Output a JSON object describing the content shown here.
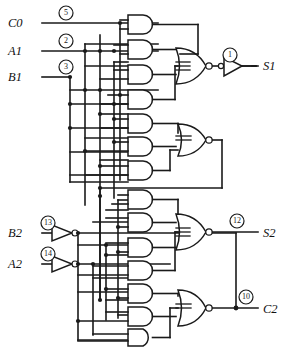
{
  "diagram": {
    "background": "#ffffff",
    "ink": "#1a1a1a"
  },
  "inputs": [
    {
      "name": "input-c0",
      "label": "C0",
      "pin": "5",
      "x": 22,
      "y": 23,
      "wire_y": 23
    },
    {
      "name": "input-a1",
      "label": "A1",
      "pin": "2",
      "x": 22,
      "y": 51,
      "wire_y": 51
    },
    {
      "name": "input-b1",
      "label": "B1",
      "pin": "3",
      "x": 22,
      "y": 77,
      "wire_y": 77
    },
    {
      "name": "input-b2",
      "label": "B2",
      "pin": "13",
      "x": 22,
      "y": 233,
      "wire_y": 233
    },
    {
      "name": "input-a2",
      "label": "A2",
      "pin": "14",
      "x": 22,
      "y": 264,
      "wire_y": 264
    }
  ],
  "outputs": [
    {
      "name": "output-s1",
      "label": "S1",
      "pin": "1",
      "x": 266,
      "y": 67
    },
    {
      "name": "output-s2",
      "label": "S2",
      "pin": "12",
      "x": 266,
      "y": 233
    },
    {
      "name": "output-c2",
      "label": "C2",
      "pin": "10",
      "x": 266,
      "y": 311
    }
  ],
  "gates": {
    "and_gates_top": [
      {
        "name": "and-gate-1",
        "x": 128,
        "y": 22
      },
      {
        "name": "and-gate-2",
        "x": 128,
        "y": 47
      },
      {
        "name": "and-gate-3",
        "x": 128,
        "y": 72
      },
      {
        "name": "and-gate-4",
        "x": 128,
        "y": 97
      },
      {
        "name": "and-gate-5",
        "x": 128,
        "y": 122
      },
      {
        "name": "and-gate-6",
        "x": 128,
        "y": 145
      },
      {
        "name": "and-gate-7",
        "x": 128,
        "y": 168
      }
    ],
    "and_gates_bottom": [
      {
        "name": "and-gate-8",
        "x": 128,
        "y": 192
      },
      {
        "name": "and-gate-9",
        "x": 128,
        "y": 215
      },
      {
        "name": "and-gate-10",
        "x": 128,
        "y": 240
      },
      {
        "name": "and-gate-11",
        "x": 128,
        "y": 263
      },
      {
        "name": "and-gate-12",
        "x": 128,
        "y": 286
      },
      {
        "name": "and-gate-13",
        "x": 128,
        "y": 309
      },
      {
        "name": "and-gate-14",
        "x": 128,
        "y": 330
      }
    ],
    "nor_gates": [
      {
        "name": "nor-gate-s1",
        "x": 190,
        "y": 57
      },
      {
        "name": "nor-gate-mid",
        "x": 190,
        "y": 140
      },
      {
        "name": "nor-gate-s2",
        "x": 190,
        "y": 223
      },
      {
        "name": "nor-gate-c2",
        "x": 190,
        "y": 301
      }
    ],
    "buffers": [
      {
        "name": "buffer-s1",
        "x": 228,
        "y": 67,
        "bubble": false
      },
      {
        "name": "inverter-b2",
        "x": 60,
        "y": 233,
        "bubble": true
      },
      {
        "name": "inverter-a2",
        "x": 60,
        "y": 264,
        "bubble": true
      }
    ]
  },
  "legend": {
    "gate_types": [
      "AND",
      "NOR",
      "INVERTER",
      "BUFFER"
    ],
    "wire_color": "#1a1a1a"
  }
}
